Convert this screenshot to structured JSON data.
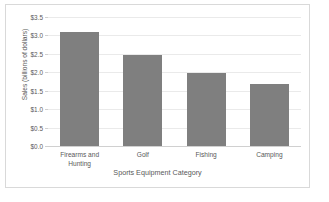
{
  "chart_data": {
    "type": "bar",
    "title": "",
    "xlabel": "Sports Equipment Category",
    "ylabel": "Sales (billions of dollars)",
    "categories": [
      "Firearms and Hunting",
      "Golf",
      "Fishing",
      "Camping"
    ],
    "values": [
      3.08,
      2.48,
      1.97,
      1.68
    ],
    "ylim": [
      0.0,
      3.5
    ],
    "ytick_values": [
      0.0,
      0.5,
      1.0,
      1.5,
      2.0,
      2.5,
      3.0,
      3.5
    ],
    "ytick_labels": [
      "$0.0",
      "$0.5",
      "$1.0",
      "$1.5",
      "$2.0",
      "$2.5",
      "$3.0",
      "$3.5"
    ],
    "grid": true,
    "legend": null,
    "bar_color": "#7f7f7f",
    "gridline_color": "#eaeaea",
    "text_color": "#595959",
    "border_color": "#d9d9d9"
  }
}
